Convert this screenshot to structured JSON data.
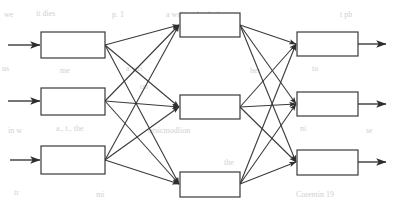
{
  "figure": {
    "kind": "block-diagram",
    "title": "",
    "width": 396,
    "height": 209,
    "background_color": "#ffffff",
    "stroke_color": "#3a3a3a",
    "box_fill_color": "#ffffff",
    "bleed_text_color": "#c9c9c9",
    "topology": "fully-connected 3-3-3 three-layer block diagram",
    "box_label": "",
    "stroke_width": 1.2
  },
  "layers": [
    {
      "name": "input-layer",
      "blocks": [
        {
          "id": "input-block-1",
          "label": "",
          "x": 41,
          "y": 32,
          "w": 64,
          "h": 26
        },
        {
          "id": "input-block-2",
          "label": "",
          "x": 41,
          "y": 88,
          "w": 64,
          "h": 27
        },
        {
          "id": "input-block-3",
          "label": "",
          "x": 41,
          "y": 146,
          "w": 64,
          "h": 28
        }
      ]
    },
    {
      "name": "middle-layer",
      "blocks": [
        {
          "id": "middle-block-1",
          "label": "",
          "x": 180,
          "y": 13,
          "w": 60,
          "h": 24
        },
        {
          "id": "middle-block-2",
          "label": "",
          "x": 180,
          "y": 95,
          "w": 60,
          "h": 24
        },
        {
          "id": "middle-block-3",
          "label": "",
          "x": 180,
          "y": 172,
          "w": 60,
          "h": 25
        }
      ]
    },
    {
      "name": "output-layer",
      "blocks": [
        {
          "id": "output-block-1",
          "label": "",
          "x": 297,
          "y": 32,
          "w": 61,
          "h": 24
        },
        {
          "id": "output-block-2",
          "label": "",
          "x": 297,
          "y": 92,
          "w": 61,
          "h": 24
        },
        {
          "id": "output-block-3",
          "label": "",
          "x": 297,
          "y": 150,
          "w": 61,
          "h": 25
        }
      ]
    }
  ],
  "input_arrows": [
    {
      "id": "input-arrow-1",
      "x1": 8,
      "y1": 45,
      "x2": 40,
      "y2": 45
    },
    {
      "id": "input-arrow-2",
      "x1": 8,
      "y1": 101,
      "x2": 40,
      "y2": 101
    },
    {
      "id": "input-arrow-3",
      "x1": 10,
      "y1": 160,
      "x2": 40,
      "y2": 160
    }
  ],
  "output_arrows": [
    {
      "id": "output-arrow-1",
      "x1": 358,
      "y1": 44,
      "x2": 386,
      "y2": 44
    },
    {
      "id": "output-arrow-2",
      "x1": 358,
      "y1": 104,
      "x2": 386,
      "y2": 104
    },
    {
      "id": "output-arrow-3",
      "x1": 358,
      "y1": 162,
      "x2": 386,
      "y2": 162
    }
  ],
  "connections_stage1": [
    {
      "id": "edge-i1-m1",
      "x1": 105,
      "y1": 45,
      "x2": 179,
      "y2": 25
    },
    {
      "id": "edge-i1-m2",
      "x1": 105,
      "y1": 45,
      "x2": 179,
      "y2": 107
    },
    {
      "id": "edge-i1-m3",
      "x1": 105,
      "y1": 45,
      "x2": 179,
      "y2": 184
    },
    {
      "id": "edge-i2-m1",
      "x1": 105,
      "y1": 101,
      "x2": 179,
      "y2": 25
    },
    {
      "id": "edge-i2-m2",
      "x1": 105,
      "y1": 101,
      "x2": 179,
      "y2": 107
    },
    {
      "id": "edge-i2-m3",
      "x1": 105,
      "y1": 101,
      "x2": 179,
      "y2": 184
    },
    {
      "id": "edge-i3-m1",
      "x1": 105,
      "y1": 160,
      "x2": 179,
      "y2": 25
    },
    {
      "id": "edge-i3-m2",
      "x1": 105,
      "y1": 160,
      "x2": 179,
      "y2": 107
    },
    {
      "id": "edge-i3-m3",
      "x1": 105,
      "y1": 160,
      "x2": 179,
      "y2": 184
    }
  ],
  "connections_stage2": [
    {
      "id": "edge-m1-o1",
      "x1": 240,
      "y1": 25,
      "x2": 296,
      "y2": 44
    },
    {
      "id": "edge-m1-o2",
      "x1": 240,
      "y1": 25,
      "x2": 296,
      "y2": 104
    },
    {
      "id": "edge-m1-o3",
      "x1": 240,
      "y1": 25,
      "x2": 296,
      "y2": 162
    },
    {
      "id": "edge-m2-o1",
      "x1": 240,
      "y1": 107,
      "x2": 296,
      "y2": 44
    },
    {
      "id": "edge-m2-o2",
      "x1": 240,
      "y1": 107,
      "x2": 296,
      "y2": 104
    },
    {
      "id": "edge-m2-o3",
      "x1": 240,
      "y1": 107,
      "x2": 296,
      "y2": 162
    },
    {
      "id": "edge-m3-o1",
      "x1": 240,
      "y1": 184,
      "x2": 296,
      "y2": 44
    },
    {
      "id": "edge-m3-o2",
      "x1": 240,
      "y1": 184,
      "x2": 296,
      "y2": 104
    },
    {
      "id": "edge-m3-o3",
      "x1": 240,
      "y1": 184,
      "x2": 296,
      "y2": 162
    }
  ],
  "bleed_through_text": [
    {
      "id": "bleed-1",
      "text": "we",
      "x": 4,
      "y": 10,
      "size": 8
    },
    {
      "id": "bleed-2",
      "text": "it dies",
      "x": 36,
      "y": 9,
      "size": 8
    },
    {
      "id": "bleed-3",
      "text": "p. 1",
      "x": 112,
      "y": 10,
      "size": 8
    },
    {
      "id": "bleed-4",
      "text": "a writing lan before",
      "x": 166,
      "y": 10,
      "size": 8
    },
    {
      "id": "bleed-5",
      "text": "t ph",
      "x": 340,
      "y": 10,
      "size": 8
    },
    {
      "id": "bleed-6",
      "text": "us",
      "x": 2,
      "y": 64,
      "size": 8
    },
    {
      "id": "bleed-7",
      "text": "me",
      "x": 60,
      "y": 66,
      "size": 8
    },
    {
      "id": "bleed-8",
      "text": "a wri",
      "x": 126,
      "y": 64,
      "size": 8
    },
    {
      "id": "bleed-9",
      "text": "her",
      "x": 250,
      "y": 66,
      "size": 8
    },
    {
      "id": "bleed-10",
      "text": "to",
      "x": 312,
      "y": 64,
      "size": 8
    },
    {
      "id": "bleed-11",
      "text": "in w",
      "x": 8,
      "y": 126,
      "size": 8
    },
    {
      "id": "bleed-12",
      "text": "a., t., the",
      "x": 56,
      "y": 124,
      "size": 8
    },
    {
      "id": "bleed-13",
      "text": "orsicmodlion",
      "x": 148,
      "y": 126,
      "size": 8
    },
    {
      "id": "bleed-14",
      "text": "ni",
      "x": 300,
      "y": 124,
      "size": 8
    },
    {
      "id": "bleed-15",
      "text": "se",
      "x": 366,
      "y": 126,
      "size": 8
    },
    {
      "id": "bleed-16",
      "text": "tr",
      "x": 14,
      "y": 188,
      "size": 8
    },
    {
      "id": "bleed-17",
      "text": "mi",
      "x": 96,
      "y": 190,
      "size": 8
    },
    {
      "id": "bleed-18",
      "text": "nt",
      "x": 196,
      "y": 188,
      "size": 8
    },
    {
      "id": "bleed-19",
      "text": "Corentin 19",
      "x": 296,
      "y": 190,
      "size": 8
    },
    {
      "id": "bleed-20",
      "text": "the",
      "x": 224,
      "y": 158,
      "size": 8
    },
    {
      "id": "bleed-21",
      "text": "on",
      "x": 140,
      "y": 82,
      "size": 8
    }
  ]
}
